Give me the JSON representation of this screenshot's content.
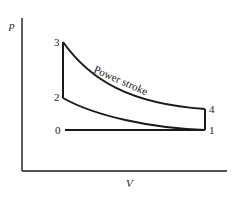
{
  "diagram": {
    "axes": {
      "y_label": "p",
      "x_label": "V"
    },
    "points": [
      {
        "id": "0",
        "label": "0"
      },
      {
        "id": "1",
        "label": "1"
      },
      {
        "id": "2",
        "label": "2"
      },
      {
        "id": "3",
        "label": "3"
      },
      {
        "id": "4",
        "label": "4"
      }
    ],
    "annotations": {
      "power_stroke": "Power stroke"
    },
    "colors": {
      "line": "#1a1a1a",
      "background": "#ffffff"
    }
  }
}
